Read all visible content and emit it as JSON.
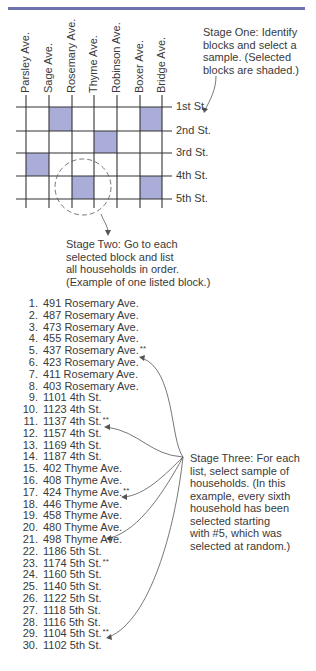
{
  "colors": {
    "accent_bar": "#6e73b0",
    "shaded_block": "#a9add8",
    "grid_line": "#333333",
    "text": "#3a3a3a"
  },
  "avenues": [
    "Parsley Ave.",
    "Sage Ave.",
    "Rosemary Ave.",
    "Thyme Ave.",
    "Robinson Ave.",
    "Boxer Ave.",
    "Bridge Ave."
  ],
  "streets": [
    "1st St.",
    "2nd St.",
    "3rd St.",
    "4th St.",
    "5th St."
  ],
  "shaded_blocks": [
    {
      "row": 0,
      "col": 1
    },
    {
      "row": 0,
      "col": 5
    },
    {
      "row": 1,
      "col": 3
    },
    {
      "row": 2,
      "col": 0
    },
    {
      "row": 3,
      "col": 2
    },
    {
      "row": 3,
      "col": 5
    }
  ],
  "stage_one": {
    "lines": [
      "Stage One: Identify",
      "blocks and select a",
      "sample. (Selected",
      "blocks are shaded.)"
    ]
  },
  "stage_two": {
    "lines": [
      "Stage Two: Go to each",
      "selected block and list",
      "all households in order.",
      "(Example of one listed block.)"
    ]
  },
  "stage_three": {
    "lines": [
      "Stage Three: For each",
      "list, select sample of",
      "households. (In this",
      "example, every sixth",
      "household has been",
      "selected starting",
      "with #5, which was",
      "selected at random.)"
    ]
  },
  "households": [
    {
      "n": "1.",
      "address": "491 Rosemary Ave.",
      "selected": false
    },
    {
      "n": "2.",
      "address": "487 Rosemary Ave.",
      "selected": false
    },
    {
      "n": "3.",
      "address": "473 Rosemary Ave.",
      "selected": false
    },
    {
      "n": "4.",
      "address": "455 Rosemary Ave.",
      "selected": false
    },
    {
      "n": "5.",
      "address": "437 Rosemary Ave.",
      "selected": true
    },
    {
      "n": "6.",
      "address": "423 Rosemary Ave.",
      "selected": false
    },
    {
      "n": "7.",
      "address": "411 Rosemary Ave.",
      "selected": false
    },
    {
      "n": "8.",
      "address": "403 Rosemary Ave.",
      "selected": false
    },
    {
      "n": "9.",
      "address": "1101 4th St.",
      "selected": false
    },
    {
      "n": "10.",
      "address": "1123 4th St.",
      "selected": false
    },
    {
      "n": "11.",
      "address": "1137 4th St.",
      "selected": true
    },
    {
      "n": "12.",
      "address": "1157 4th St.",
      "selected": false
    },
    {
      "n": "13.",
      "address": "1169 4th St.",
      "selected": false
    },
    {
      "n": "14.",
      "address": "1187 4th St.",
      "selected": false
    },
    {
      "n": "15.",
      "address": "402 Thyme Ave.",
      "selected": false
    },
    {
      "n": "16.",
      "address": "408 Thyme Ave.",
      "selected": false
    },
    {
      "n": "17.",
      "address": "424 Thyme Ave.",
      "selected": true
    },
    {
      "n": "18.",
      "address": "446 Thyme Ave.",
      "selected": false
    },
    {
      "n": "19.",
      "address": "458 Thyme Ave.",
      "selected": false
    },
    {
      "n": "20.",
      "address": "480 Thyme Ave.",
      "selected": false
    },
    {
      "n": "21.",
      "address": "498 Thyme Ave.",
      "selected": false
    },
    {
      "n": "22.",
      "address": "1186 5th St.",
      "selected": false
    },
    {
      "n": "23.",
      "address": "1174 5th St.",
      "selected": true
    },
    {
      "n": "24.",
      "address": "1160 5th St.",
      "selected": false
    },
    {
      "n": "25.",
      "address": "1140 5th St.",
      "selected": false
    },
    {
      "n": "26.",
      "address": "1122 5th St.",
      "selected": false
    },
    {
      "n": "27.",
      "address": "1118 5th St.",
      "selected": false
    },
    {
      "n": "28.",
      "address": "1116 5th St.",
      "selected": false
    },
    {
      "n": "29.",
      "address": "1104 5th St.",
      "selected": true
    },
    {
      "n": "30.",
      "address": "1102 5th St.",
      "selected": false
    }
  ],
  "selected_marker": "**"
}
